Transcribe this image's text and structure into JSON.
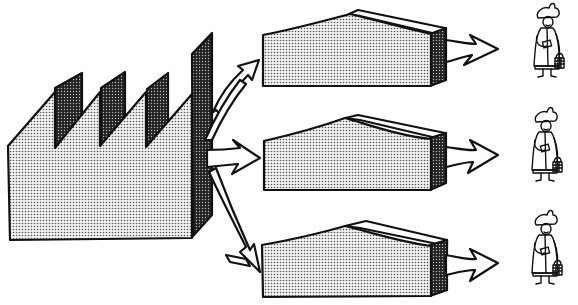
{
  "diagram": {
    "type": "distribution-flow-illustration",
    "colors": {
      "background": "#ffffff",
      "outline": "#111111",
      "light_stipple": "#d8d8d8",
      "dark_stipple": "#3a3a3a",
      "arrow_fill": "#ffffff"
    },
    "nodes": [
      {
        "id": "factory",
        "kind": "factory",
        "label": ""
      },
      {
        "id": "warehouse-1",
        "kind": "warehouse",
        "label": "",
        "y": 20
      },
      {
        "id": "warehouse-2",
        "kind": "warehouse",
        "label": "",
        "y": 120
      },
      {
        "id": "warehouse-3",
        "kind": "warehouse",
        "label": "",
        "y": 220
      },
      {
        "id": "customer-1",
        "kind": "customer",
        "label": "",
        "y": 8
      },
      {
        "id": "customer-2",
        "kind": "customer",
        "label": "",
        "y": 112
      },
      {
        "id": "customer-3",
        "kind": "customer",
        "label": "",
        "y": 212
      }
    ],
    "edges": [
      {
        "from": "factory",
        "to": "warehouse-1"
      },
      {
        "from": "factory",
        "to": "warehouse-2"
      },
      {
        "from": "factory",
        "to": "warehouse-3"
      },
      {
        "from": "warehouse-1",
        "to": "customer-1"
      },
      {
        "from": "warehouse-2",
        "to": "customer-2"
      },
      {
        "from": "warehouse-3",
        "to": "customer-3"
      }
    ]
  }
}
